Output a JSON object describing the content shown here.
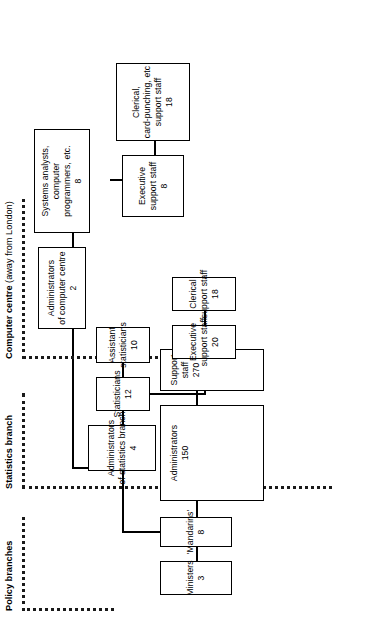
{
  "chart_data": {
    "type": "diagram",
    "sections": [
      {
        "id": "policy",
        "label": "Policy branches"
      },
      {
        "id": "stats",
        "label": "Statistics branch"
      },
      {
        "id": "computer",
        "label_bold": "Computer centre",
        "label_rest": " (away from London)"
      }
    ],
    "nodes": [
      {
        "id": "ministers",
        "lines": [
          "Ministers"
        ],
        "count": "3",
        "section": "policy"
      },
      {
        "id": "mandarins",
        "lines": [
          "'Mandarins'"
        ],
        "count": "8",
        "section": "policy"
      },
      {
        "id": "administrators",
        "lines": [
          "Administrators"
        ],
        "count": "150",
        "section": "policy"
      },
      {
        "id": "support-staff",
        "lines": [
          "Support",
          "staff"
        ],
        "count": "270",
        "section": "policy"
      },
      {
        "id": "admin-stats",
        "lines": [
          "Administrators",
          "of statistics branch"
        ],
        "count": "4",
        "section": "stats"
      },
      {
        "id": "statisticians",
        "lines": [
          "Statisticians"
        ],
        "count": "12",
        "section": "stats"
      },
      {
        "id": "asst-stats",
        "lines": [
          "Assistant",
          "statisticians"
        ],
        "count": "10",
        "section": "stats"
      },
      {
        "id": "exec-stats",
        "lines": [
          "Executive",
          "support staff"
        ],
        "count": "20",
        "section": "stats"
      },
      {
        "id": "clerical-stats",
        "lines": [
          "Clerical",
          "support staff"
        ],
        "count": "18",
        "section": "stats"
      },
      {
        "id": "admin-cc",
        "lines": [
          "Administrators",
          "of computer centre"
        ],
        "count": "2",
        "section": "computer"
      },
      {
        "id": "systems",
        "lines": [
          "Systems analysts,",
          "computer",
          "programmers, etc."
        ],
        "count": "8",
        "section": "computer"
      },
      {
        "id": "exec-cc",
        "lines": [
          "Executive",
          "support staff"
        ],
        "count": "8",
        "section": "computer"
      },
      {
        "id": "clerical-cc",
        "lines": [
          "Clerical,",
          "card-punching, etc",
          "support staff"
        ],
        "count": "18",
        "section": "computer"
      }
    ],
    "edges": [
      {
        "from": "ministers",
        "to": "mandarins"
      },
      {
        "from": "mandarins",
        "to": "administrators"
      },
      {
        "from": "administrators",
        "to": "support-staff"
      },
      {
        "from": "mandarins",
        "to": "admin-stats"
      },
      {
        "from": "admin-stats",
        "to": "statisticians"
      },
      {
        "from": "statisticians",
        "to": "asst-stats"
      },
      {
        "from": "statisticians",
        "to": "exec-stats"
      },
      {
        "from": "exec-stats",
        "to": "clerical-stats"
      },
      {
        "from": "admin-stats",
        "to": "admin-cc"
      },
      {
        "from": "admin-cc",
        "to": "systems"
      },
      {
        "from": "systems",
        "to": "exec-cc"
      },
      {
        "from": "exec-cc",
        "to": "clerical-cc"
      }
    ]
  },
  "colors": {
    "line": "#000000",
    "box_border": "#000000",
    "background": "#ffffff"
  }
}
